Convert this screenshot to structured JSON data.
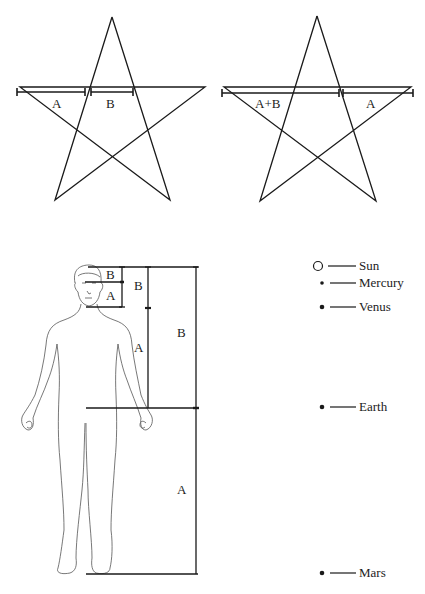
{
  "pentagram_left": {
    "labels": {
      "segment_1": "A",
      "segment_2": "B"
    }
  },
  "pentagram_right": {
    "labels": {
      "segment_1": "A+B",
      "segment_2": "A"
    }
  },
  "human_figure": {
    "labels": {
      "head_top": "B",
      "head_bottom": "A",
      "upper_body_top": "B",
      "upper_body_bottom": "A",
      "full_upper": "B",
      "full_lower": "A"
    }
  },
  "planets": [
    {
      "name": "Sun",
      "marker": "hollow-circle"
    },
    {
      "name": "Mercury",
      "marker": "small-dot"
    },
    {
      "name": "Venus",
      "marker": "dot"
    },
    {
      "name": "Earth",
      "marker": "dot"
    },
    {
      "name": "Mars",
      "marker": "dot"
    }
  ],
  "colors": {
    "line": "#1a1a1a",
    "figure": "#555555",
    "background": "#ffffff"
  }
}
